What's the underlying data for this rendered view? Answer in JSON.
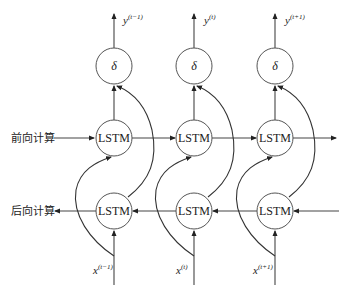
{
  "diagram": {
    "forward_label": "前向计算",
    "backward_label": "后向计算",
    "columns": [
      {
        "output_node": "δ",
        "forward_node": "LSTM",
        "backward_node": "LSTM",
        "output": {
          "base": "y",
          "sup": "(t−1)"
        },
        "input": {
          "base": "x",
          "sup": "(t−1)"
        }
      },
      {
        "output_node": "δ",
        "forward_node": "LSTM",
        "backward_node": "LSTM",
        "output": {
          "base": "y",
          "sup": "(t)"
        },
        "input": {
          "base": "x",
          "sup": "(t)"
        }
      },
      {
        "output_node": "δ",
        "forward_node": "LSTM",
        "backward_node": "LSTM",
        "output": {
          "base": "y",
          "sup": "(t+1)"
        },
        "input": {
          "base": "x",
          "sup": "(t+1)"
        }
      }
    ],
    "colors": {
      "stroke": "#444444",
      "background": "#ffffff",
      "text": "#222222"
    }
  }
}
